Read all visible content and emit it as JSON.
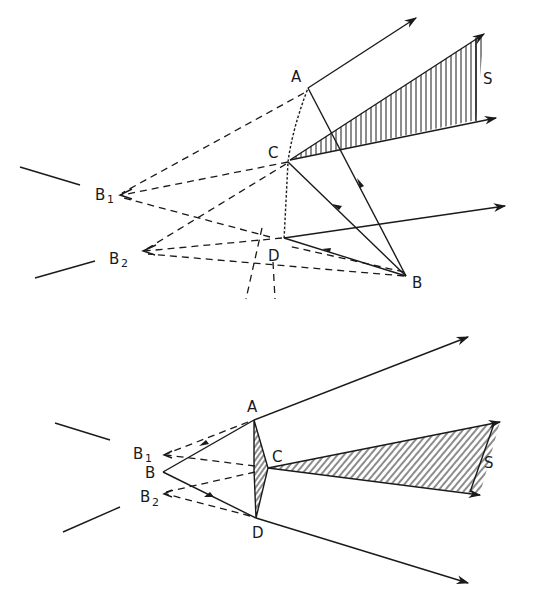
{
  "figure": {
    "top_diagram": {
      "labels": {
        "A": "A",
        "C": "C",
        "D": "D",
        "B": "B",
        "B1": "B",
        "B1_sub": "1",
        "B2": "B",
        "B2_sub": "2",
        "S": "S"
      }
    },
    "bottom_diagram": {
      "labels": {
        "A": "A",
        "C": "C",
        "D": "D",
        "B": "B",
        "B1": "B",
        "B1_sub": "1",
        "B2": "B",
        "B2_sub": "2",
        "S": "S"
      }
    }
  }
}
